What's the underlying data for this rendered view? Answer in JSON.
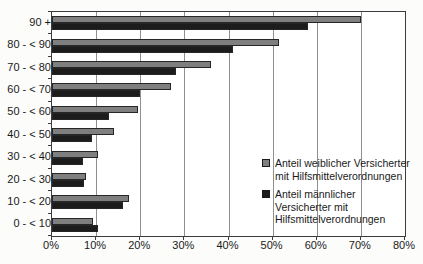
{
  "chart_data": {
    "type": "bar",
    "orientation": "horizontal",
    "title": "",
    "xlabel": "",
    "ylabel": "",
    "categories": [
      "90 +",
      "80 - < 90",
      "70 - < 80",
      "60 - < 70",
      "50 - < 60",
      "40 - < 50",
      "30 - < 40",
      "20 - < 30",
      "10 - < 20",
      "0 - < 10"
    ],
    "series": [
      {
        "name": "Anteil weiblicher Versicherter mit Hilfsmittelverordnungen",
        "color": "#7f7f7f",
        "values": [
          70,
          51.5,
          36,
          27,
          19.5,
          14,
          10.5,
          7.7,
          17.5,
          9.3
        ]
      },
      {
        "name": "Anteil männlicher Versicherter mit Hilfsmittelverordnungen",
        "color": "#1c1c1c",
        "values": [
          58,
          41,
          28,
          20,
          13,
          9,
          7,
          7.2,
          16,
          10.4
        ]
      }
    ],
    "xlim": [
      0,
      80
    ],
    "x_tick_labels": [
      "0%",
      "10%",
      "20%",
      "30%",
      "40%",
      "50%",
      "60%",
      "70%",
      "80%"
    ],
    "x_tick_values": [
      0,
      10,
      20,
      30,
      40,
      50,
      60,
      70,
      80
    ],
    "grid": true,
    "legend_position": "inside-right",
    "bar_border_color": "#262626",
    "plot_border_color": "#3c3c3c"
  }
}
